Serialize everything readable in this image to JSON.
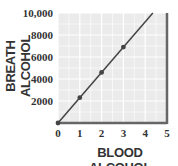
{
  "chart_data": {
    "type": "line",
    "title": "",
    "xlabel": "BLOOD ALCOHOL",
    "ylabel": "BREATH ALCOHOL",
    "xlim": [
      0,
      5
    ],
    "ylim": [
      0,
      10000
    ],
    "x_ticks": [
      "0",
      "1",
      "2",
      "3",
      "4",
      "5"
    ],
    "y_ticks": [
      "2000",
      "4000",
      "6000",
      "8000",
      "10,000"
    ],
    "grid": true,
    "legend": null,
    "series": [
      {
        "name": "Breath vs Blood Alcohol",
        "x": [
          0,
          1,
          2,
          3
        ],
        "y": [
          0,
          2300,
          4600,
          6900
        ],
        "line_extends_to": {
          "x": 4.35,
          "y": 10000
        },
        "markers": true
      }
    ]
  },
  "colors": {
    "plot_background": "#ebebeb",
    "grid_line": "#ffffff",
    "axis_frame": "#666666",
    "line": "#444444",
    "text": "#333333"
  }
}
